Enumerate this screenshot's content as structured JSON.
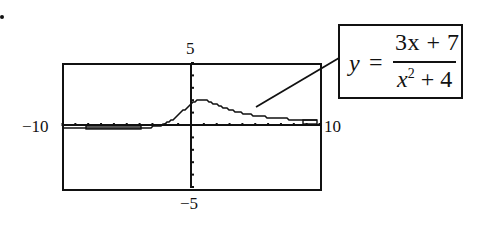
{
  "chart_data": {
    "type": "line",
    "title": "",
    "function": "y = (3x + 7) / (x^2 + 4)",
    "xlim": [
      -10,
      10
    ],
    "ylim": [
      -5,
      5
    ],
    "xscale": 1,
    "yscale": 1,
    "xlabel": "",
    "ylabel": "",
    "tick_labels": {
      "xmin": "−10",
      "xmax": "10",
      "ymax": "5",
      "ymin": "−5"
    },
    "grid": false,
    "x": [
      -10,
      -8,
      -6,
      -4,
      -3,
      -2,
      -1,
      -0.5,
      0,
      0.5,
      1,
      1.5,
      2,
      3,
      4,
      5,
      6,
      7,
      8,
      9,
      10
    ],
    "values": [
      -0.221,
      -0.25,
      -0.275,
      -0.25,
      -0.154,
      0.125,
      0.8,
      1.294,
      1.75,
      2.0,
      2.0,
      1.84,
      1.625,
      1.231,
      0.95,
      0.759,
      0.625,
      0.528,
      0.456,
      0.4,
      0.356
    ]
  },
  "figure": {
    "bullet": "•",
    "label_ymax": "5",
    "label_ymin": "−5",
    "label_xmin": "−10",
    "label_xmax": "10",
    "equation": {
      "lhs": "y",
      "equals": "=",
      "numerator": "3x + 7",
      "denominator_base": "x",
      "denominator_exp": "2",
      "denominator_rest": "+ 4"
    }
  }
}
